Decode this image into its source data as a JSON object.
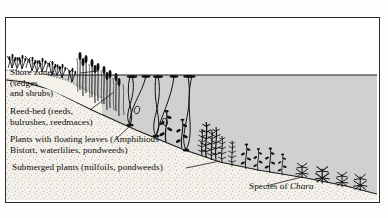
{
  "figure": {
    "type": "cross-section-diagram",
    "frame": {
      "border_color": "#2a2a2a",
      "background": "#ffffff"
    }
  },
  "scene": {
    "sky": {
      "name": "sky-area",
      "color": "#ffffff"
    },
    "water": {
      "name": "water-body",
      "color": "#cfcfcf",
      "surface_line_y": 57
    },
    "substrate": {
      "name": "lake-bed",
      "color": "#f2efe9",
      "stipple_color": "#3a3a3a"
    },
    "vegetation_ink": "#111111"
  },
  "labels": {
    "shore": {
      "name": "shore-zone-label",
      "line1": "Shore zones",
      "line2": "(sedges",
      "line3": "and shrubs)"
    },
    "reed": {
      "name": "reed-bed-label",
      "line1": "Reed-bed (reeds,",
      "line2": "bulrushes, reedmaces)"
    },
    "floating": {
      "name": "floating-leaf-label",
      "line1": "Plants with floating leaves (Amphibious",
      "line2": "Bistort, waterlilies, pondweeds)"
    },
    "submerged": {
      "name": "submerged-plant-label",
      "line1": "Submerged plants (milfoils, pondweeds)"
    },
    "chara": {
      "name": "chara-label",
      "prefix": "Species of ",
      "genus": "Chara"
    }
  },
  "zones": [
    {
      "id": "shore",
      "order": 1,
      "label": "Shore zones (sedges and shrubs)"
    },
    {
      "id": "reed",
      "order": 2,
      "label": "Reed-bed (reeds, bulrushes, reedmaces)"
    },
    {
      "id": "floating",
      "order": 3,
      "label": "Plants with floating leaves (Amphibious Bistort, waterlilies, pondweeds)"
    },
    {
      "id": "submerged",
      "order": 4,
      "label": "Submerged plants (milfoils, pondweeds)"
    },
    {
      "id": "chara",
      "order": 5,
      "label": "Species of Chara"
    }
  ]
}
